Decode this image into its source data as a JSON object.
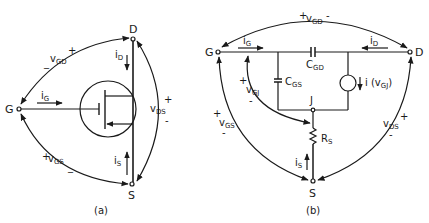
{
  "figure_a": {
    "caption": "(a)",
    "terminals": {
      "gate": "G",
      "drain": "D",
      "source": "S"
    },
    "currents": {
      "i_G": {
        "main": "i",
        "sub": "G"
      },
      "i_D": {
        "main": "i",
        "sub": "D"
      },
      "i_S": {
        "main": "i",
        "sub": "S"
      }
    },
    "voltages": {
      "v_GD": {
        "main": "v",
        "sub": "GD",
        "plus": "+",
        "minus": "_"
      },
      "v_GS": {
        "main": "v",
        "sub": "GS",
        "plus": "+",
        "minus": "_"
      },
      "v_DS": {
        "main": "v",
        "sub": "DS",
        "plus": "+",
        "minus": "-"
      }
    }
  },
  "figure_b": {
    "caption": "(b)",
    "terminals": {
      "gate": "G",
      "drain": "D",
      "source": "S",
      "internal": "J"
    },
    "components": {
      "C_GD": {
        "main": "C",
        "sub": "GD"
      },
      "C_GS": {
        "main": "C",
        "sub": "GS"
      },
      "R_S": {
        "main": "R",
        "sub": "S"
      },
      "source": {
        "prefix": "i (v",
        "sub": "GJ",
        "suffix": ")"
      }
    },
    "currents": {
      "i_G": {
        "main": "i",
        "sub": "G"
      },
      "i_D": {
        "main": "i",
        "sub": "D"
      },
      "i_S": {
        "main": "i",
        "sub": "S"
      }
    },
    "voltages": {
      "v_GD": {
        "main": "v",
        "sub": "GD",
        "plus": "+",
        "minus": "-"
      },
      "v_GJ": {
        "main": "v",
        "sub": "GJ",
        "plus": "+",
        "minus": "-"
      },
      "v_GS": {
        "main": "v",
        "sub": "GS",
        "plus": "+",
        "minus": "-"
      },
      "v_DS": {
        "main": "v",
        "sub": "DS",
        "plus": "+",
        "minus": "-"
      }
    }
  },
  "colors": {
    "ink": "#1a1a1a",
    "background": "#ffffff"
  }
}
